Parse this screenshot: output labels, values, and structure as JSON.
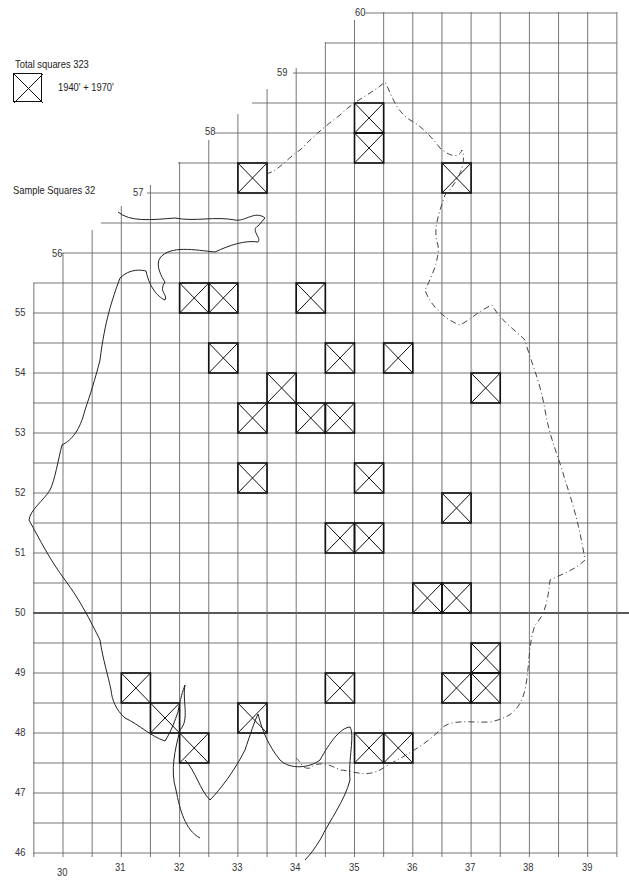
{
  "legend": {
    "title": "Total squares 323",
    "symbol": "crossed-square-icon",
    "symbol_label": "1940' + 1970'",
    "sample_text": "Sample Squares 32"
  },
  "grid": {
    "lon_min": 29.5,
    "lon_max": 39.5,
    "lat_min": 46,
    "lat_max": 60,
    "cell_size_deg": 0.5,
    "highlight_lat_line": 50
  },
  "lat_labels": [
    {
      "value": "60",
      "lat": 60
    },
    {
      "value": "59",
      "lat": 59
    },
    {
      "value": "58",
      "lat": 58
    },
    {
      "value": "57",
      "lat": 57
    },
    {
      "value": "56",
      "lat": 56
    },
    {
      "value": "55",
      "lat": 55
    },
    {
      "value": "54",
      "lat": 54
    },
    {
      "value": "53",
      "lat": 53
    },
    {
      "value": "52",
      "lat": 52
    },
    {
      "value": "51",
      "lat": 51
    },
    {
      "value": "50",
      "lat": 50
    },
    {
      "value": "49",
      "lat": 49
    },
    {
      "value": "48",
      "lat": 48
    },
    {
      "value": "47",
      "lat": 47
    },
    {
      "value": "46",
      "lat": 46
    }
  ],
  "lon_labels": [
    {
      "value": "30",
      "lon": 30
    },
    {
      "value": "31",
      "lon": 31
    },
    {
      "value": "32",
      "lon": 32
    },
    {
      "value": "33",
      "lon": 33
    },
    {
      "value": "34",
      "lon": 34
    },
    {
      "value": "35",
      "lon": 35
    },
    {
      "value": "36",
      "lon": 36
    },
    {
      "value": "37",
      "lon": 37
    },
    {
      "value": "38",
      "lon": 38
    },
    {
      "value": "39",
      "lon": 39
    }
  ],
  "sample_squares": [
    {
      "lon": 33,
      "lat": 57
    },
    {
      "lon": 35,
      "lat": 58
    },
    {
      "lon": 35,
      "lat": 57.5
    },
    {
      "lon": 36.5,
      "lat": 57
    },
    {
      "lon": 32,
      "lat": 55
    },
    {
      "lon": 32.5,
      "lat": 55
    },
    {
      "lon": 34,
      "lat": 55
    },
    {
      "lon": 32.5,
      "lat": 54
    },
    {
      "lon": 34.5,
      "lat": 54
    },
    {
      "lon": 35.5,
      "lat": 54
    },
    {
      "lon": 33.5,
      "lat": 53.5
    },
    {
      "lon": 37,
      "lat": 53.5
    },
    {
      "lon": 33,
      "lat": 53
    },
    {
      "lon": 34,
      "lat": 53
    },
    {
      "lon": 34.5,
      "lat": 53
    },
    {
      "lon": 33,
      "lat": 52
    },
    {
      "lon": 35,
      "lat": 52
    },
    {
      "lon": 36.5,
      "lat": 51.5
    },
    {
      "lon": 34.5,
      "lat": 51
    },
    {
      "lon": 35,
      "lat": 51
    },
    {
      "lon": 36,
      "lat": 50
    },
    {
      "lon": 36.5,
      "lat": 50
    },
    {
      "lon": 37,
      "lat": 49
    },
    {
      "lon": 31,
      "lat": 48.5
    },
    {
      "lon": 34.5,
      "lat": 48.5
    },
    {
      "lon": 36.5,
      "lat": 48.5
    },
    {
      "lon": 37,
      "lat": 48.5
    },
    {
      "lon": 31.5,
      "lat": 48
    },
    {
      "lon": 33,
      "lat": 48
    },
    {
      "lon": 32,
      "lat": 47.5
    },
    {
      "lon": 35,
      "lat": 47.5
    },
    {
      "lon": 35.5,
      "lat": 47.5
    }
  ],
  "colors": {
    "line": "#222222",
    "grid": "#555555",
    "square": "#111111",
    "background": "#ffffff"
  }
}
